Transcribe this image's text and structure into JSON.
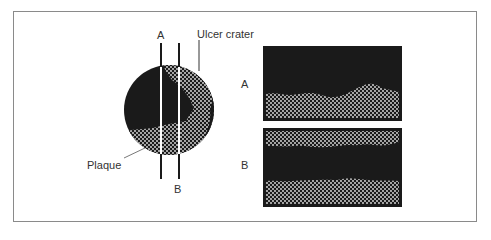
{
  "figure": {
    "labels": {
      "cut_a": "A",
      "cut_b": "B",
      "ulcer_crater": "Ulcer crater",
      "plaque": "Plaque",
      "panel_a": "A",
      "panel_b": "B"
    },
    "colors": {
      "lumen": "#1a1a1a",
      "plaque_fill": "#1a1a1a",
      "plaque_dots": "#e8e8e8",
      "frame_border": "#8a8a8a",
      "text": "#333333"
    }
  }
}
